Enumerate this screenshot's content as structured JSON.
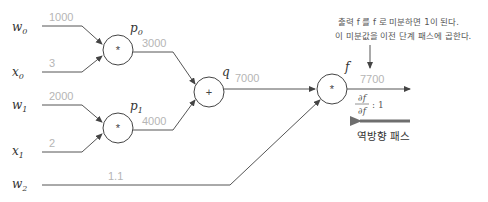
{
  "inputs": [
    {
      "id": "w0",
      "base": "w",
      "sub": "0",
      "value": "1000"
    },
    {
      "id": "x0",
      "base": "x",
      "sub": "0",
      "value": "3"
    },
    {
      "id": "w1",
      "base": "w",
      "sub": "1",
      "value": "2000"
    },
    {
      "id": "x1",
      "base": "x",
      "sub": "1",
      "value": "2"
    },
    {
      "id": "w2",
      "base": "w",
      "sub": "2",
      "value": "1.1"
    }
  ],
  "nodes": [
    {
      "id": "p0",
      "op": "*",
      "label_base": "p",
      "label_sub": "0",
      "output": "3000"
    },
    {
      "id": "p1",
      "op": "*",
      "label_base": "p",
      "label_sub": "1",
      "output": "4000"
    },
    {
      "id": "q",
      "op": "+",
      "label_base": "q",
      "label_sub": "",
      "output": "7000"
    },
    {
      "id": "f",
      "op": "*",
      "label_base": "f",
      "label_sub": "",
      "output": "7700"
    }
  ],
  "annotation": {
    "line1": "출력 f 를 f 로 미분하면 1이 된다.",
    "line2": "이 미분값을 이전 단계 패스에 곱한다."
  },
  "derivative": {
    "numerator": "∂f",
    "denominator": "∂f",
    "value": ": 1"
  },
  "backward_label": "역방향 패스",
  "colors": {
    "wire": "#555555",
    "value_text": "#b5b5b5",
    "backward_arrow": "#6e6e6e"
  }
}
